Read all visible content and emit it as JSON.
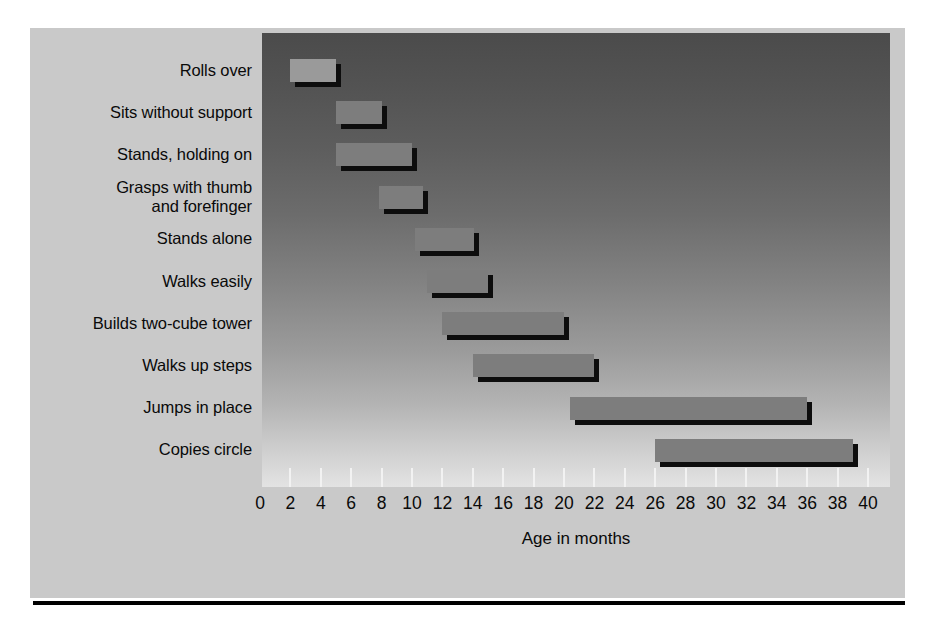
{
  "chart_data": {
    "type": "bar",
    "orientation": "horizontal",
    "subtype": "range-bar",
    "title": "",
    "xlabel": "Age in months",
    "ylabel": "",
    "xlim": [
      0,
      40
    ],
    "xtick_step": 2,
    "xticks": [
      0,
      2,
      4,
      6,
      8,
      10,
      12,
      14,
      16,
      18,
      20,
      22,
      24,
      26,
      28,
      30,
      32,
      34,
      36,
      38,
      40
    ],
    "grid": false,
    "legend": null,
    "categories": [
      "Rolls over",
      "Sits without support",
      "Stands, holding on",
      "Grasps with thumb\nand forefinger",
      "Stands alone",
      "Walks easily",
      "Builds two-cube tower",
      "Walks up steps",
      "Jumps in place",
      "Copies circle"
    ],
    "ranges": [
      {
        "label": "Rolls over",
        "start": 2,
        "end": 5
      },
      {
        "label": "Sits without support",
        "start": 5,
        "end": 8
      },
      {
        "label": "Stands, holding on",
        "start": 5,
        "end": 10
      },
      {
        "label": "Grasps with thumb and forefinger",
        "start": 7.8,
        "end": 10.7
      },
      {
        "label": "Stands alone",
        "start": 10.2,
        "end": 14.1
      },
      {
        "label": "Walks easily",
        "start": 11,
        "end": 15
      },
      {
        "label": "Builds two-cube tower",
        "start": 12,
        "end": 20
      },
      {
        "label": "Walks up steps",
        "start": 14,
        "end": 22
      },
      {
        "label": "Jumps in place",
        "start": 20.4,
        "end": 36
      },
      {
        "label": "Copies circle",
        "start": 26,
        "end": 39
      }
    ]
  },
  "axis": {
    "title": "Age in months"
  },
  "colors": {
    "page_background": "#ffffff",
    "card_background": "#c9c9c9",
    "plot_gradient_top": "#4b4b4b",
    "plot_gradient_bottom": "#e3e3e3",
    "bar_fill": "#7d7d7d",
    "bar_shadow": "#0d0d0d",
    "tick_mark": "#f2f2f2",
    "text": "#0a0a0a",
    "rule": "#000000"
  }
}
